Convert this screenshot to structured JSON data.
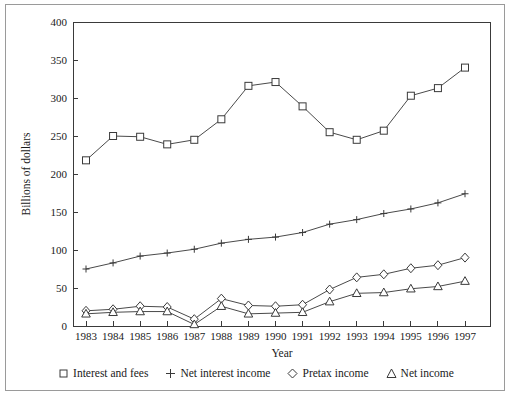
{
  "chart_data": {
    "type": "line",
    "title": "",
    "xlabel": "Year",
    "ylabel": "Billions of dollars",
    "categories": [
      "1983",
      "1984",
      "1985",
      "1986",
      "1987",
      "1988",
      "1989",
      "1990",
      "1991",
      "1992",
      "1993",
      "1994",
      "1995",
      "1996",
      "1997"
    ],
    "x": [
      1983,
      1984,
      1985,
      1986,
      1987,
      1988,
      1989,
      1990,
      1991,
      1992,
      1993,
      1994,
      1995,
      1996,
      1997
    ],
    "xlim": [
      1983,
      1997
    ],
    "ylim": [
      0,
      400
    ],
    "y_ticks": [
      0,
      50,
      100,
      150,
      200,
      250,
      300,
      350,
      400
    ],
    "x_ticks": [
      "1983",
      "1984",
      "1985",
      "1986",
      "1987",
      "1988",
      "1989",
      "1990",
      "1991",
      "1992",
      "1993",
      "1994",
      "1995",
      "1996",
      "1997"
    ],
    "grid": false,
    "legend_position": "below",
    "series": [
      {
        "name": "Interest and fees",
        "marker": "square",
        "values": [
          218,
          250,
          249,
          239,
          245,
          272,
          316,
          321,
          289,
          255,
          245,
          257,
          303,
          313,
          340
        ]
      },
      {
        "name": "Net interest income",
        "marker": "plus",
        "values": [
          75,
          83,
          92,
          96,
          101,
          109,
          114,
          117,
          123,
          134,
          140,
          148,
          154,
          162,
          174
        ]
      },
      {
        "name": "Pretax income",
        "marker": "diamond",
        "values": [
          20,
          22,
          26,
          25,
          9,
          36,
          27,
          26,
          28,
          48,
          64,
          68,
          76,
          80,
          90
        ]
      },
      {
        "name": "Net income",
        "marker": "triangle",
        "values": [
          16,
          18,
          19,
          19,
          2,
          26,
          16,
          17,
          18,
          32,
          43,
          44,
          49,
          52,
          59
        ]
      }
    ]
  },
  "legend": {
    "items": [
      {
        "label": "Interest and fees",
        "marker": "square"
      },
      {
        "label": "Net interest income",
        "marker": "plus"
      },
      {
        "label": "Pretax income",
        "marker": "diamond"
      },
      {
        "label": "Net income",
        "marker": "triangle"
      }
    ]
  },
  "axes": {
    "y_title": "Billions of dollars",
    "x_title": "Year"
  },
  "colors": {
    "line": "#4a4a4a",
    "axis": "#3a3a3a",
    "text": "#1a1a1a",
    "frame": "#9a9a9a",
    "background": "#ffffff"
  }
}
